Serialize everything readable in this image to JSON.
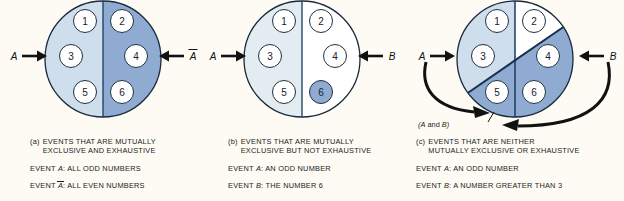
{
  "figure": {
    "colors": {
      "background": "#fdfbf4",
      "light_blue": "#cfdeec",
      "medium_blue": "#8fabd2",
      "pale_blue": "#e3edf1",
      "white": "#ffffff",
      "outline": "#1a2a3a",
      "arrow": "#111111",
      "text": "#1b1b1b"
    }
  },
  "panels": [
    {
      "id": "a",
      "tag": "(a)",
      "caption_head": [
        "EVENTS THAT ARE MUTUALLY",
        "EXCLUSIVE AND EXHAUSTIVE"
      ],
      "event_a_prefix": "EVENT ",
      "event_a_symbol": "A",
      "event_a_text": ": ALL ODD NUMBERS",
      "event_b_prefix": "EVENT ",
      "event_b_symbol": "A",
      "event_b_symbol_overbar": true,
      "event_b_text": ": ALL EVEN NUMBERS",
      "left_label": "A",
      "left_label_overbar": false,
      "right_label": "A",
      "right_label_overbar": true,
      "left_fill": "#cfdeec",
      "right_fill": "#8fabd2",
      "outcomes": [
        {
          "n": "1",
          "col": "left",
          "fill": "#ffffff"
        },
        {
          "n": "2",
          "col": "right",
          "fill": "#ffffff"
        },
        {
          "n": "3",
          "col": "left",
          "fill": "#ffffff"
        },
        {
          "n": "4",
          "col": "right",
          "fill": "#ffffff"
        },
        {
          "n": "5",
          "col": "left",
          "fill": "#ffffff"
        },
        {
          "n": "6",
          "col": "right",
          "fill": "#ffffff"
        }
      ]
    },
    {
      "id": "b",
      "tag": "(b)",
      "caption_head": [
        "EVENTS THAT ARE MUTUALLY",
        "EXCLUSIVE BUT NOT EXHAUSTIVE"
      ],
      "event_a_prefix": "EVENT ",
      "event_a_symbol": "A",
      "event_a_text": ": AN ODD NUMBER",
      "event_b_prefix": "EVENT ",
      "event_b_symbol": "B",
      "event_b_symbol_overbar": false,
      "event_b_text": ": THE NUMBER 6",
      "left_label": "A",
      "left_label_overbar": false,
      "right_label": "B",
      "right_label_overbar": false,
      "left_fill": "#e3edf1",
      "right_fill": "#ffffff",
      "outcomes": [
        {
          "n": "1",
          "col": "left",
          "fill": "#ffffff"
        },
        {
          "n": "2",
          "col": "right",
          "fill": "#ffffff"
        },
        {
          "n": "3",
          "col": "left",
          "fill": "#ffffff"
        },
        {
          "n": "4",
          "col": "right",
          "fill": "#ffffff"
        },
        {
          "n": "5",
          "col": "left",
          "fill": "#ffffff"
        },
        {
          "n": "6",
          "col": "right",
          "fill": "#8fabd2"
        }
      ]
    },
    {
      "id": "c",
      "tag": "(c)",
      "caption_head": [
        "EVENTS THAT ARE NEITHER",
        "MUTUALLY EXCLUSIVE OR EXHAUSTIVE"
      ],
      "event_a_prefix": "EVENT ",
      "event_a_symbol": "A",
      "event_a_text": ": AN ODD NUMBER",
      "event_b_prefix": "EVENT ",
      "event_b_symbol": "B",
      "event_b_symbol_overbar": false,
      "event_b_text": ": A NUMBER GREATER THAN 3",
      "left_label": "A",
      "left_label_overbar": false,
      "right_label": "B",
      "right_label_overbar": false,
      "intersection_label_open": "(",
      "intersection_label_a": "A",
      "intersection_label_and": " and ",
      "intersection_label_b": "B",
      "intersection_label_close": ")",
      "region_a_only_fill": "#cfdeec",
      "region_b_fill": "#8fabd2",
      "region_neither_fill": "#ffffff",
      "outcomes": [
        {
          "n": "1",
          "col": "left",
          "fill": "#ffffff"
        },
        {
          "n": "2",
          "col": "right",
          "fill": "#ffffff"
        },
        {
          "n": "3",
          "col": "left",
          "fill": "#ffffff"
        },
        {
          "n": "4",
          "col": "right",
          "fill": "#ffffff"
        },
        {
          "n": "5",
          "col": "left",
          "fill": "#ffffff"
        },
        {
          "n": "6",
          "col": "right",
          "fill": "#ffffff"
        }
      ]
    }
  ]
}
